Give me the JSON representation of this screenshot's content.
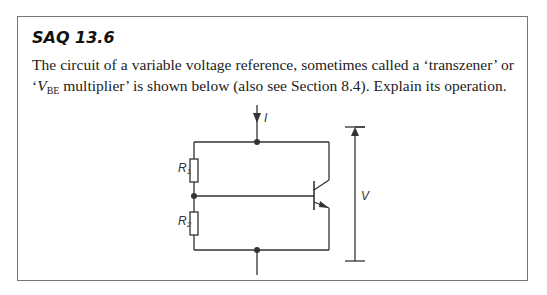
{
  "saq": {
    "title": "SAQ 13.6",
    "text_part1": "The circuit of a variable voltage reference, sometimes called a ‘transzener’ or ‘",
    "vbe_v": "V",
    "vbe_sub": "BE",
    "text_part2": " multiplier’ is shown below (also see Section 8.4). Explain its operation."
  },
  "diagram": {
    "current_label": "I",
    "r1_label": "R",
    "r1_sub": "1",
    "r2_label": "R",
    "r2_sub": "2",
    "voltage_label": "V"
  }
}
